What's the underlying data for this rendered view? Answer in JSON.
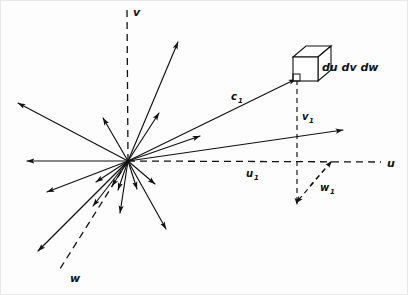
{
  "figure": {
    "background_color": "#fdfdfd",
    "ink_color": "#111111",
    "width": 408,
    "height": 295
  },
  "origin": {
    "x": 128,
    "y": 161,
    "label": ""
  },
  "axes": [
    {
      "name": "u",
      "label": "u",
      "label_x": 389,
      "label_y": 166,
      "style": "dashed",
      "from": {
        "x": 128,
        "y": 161
      },
      "to": {
        "x": 381,
        "y": 162
      }
    },
    {
      "name": "v",
      "label": "v",
      "label_x": 133,
      "label_y": 15,
      "style": "dashed",
      "from": {
        "x": 128,
        "y": 161
      },
      "to": {
        "x": 127,
        "y": 8
      }
    },
    {
      "name": "w",
      "label": "w",
      "label_x": 69,
      "label_y": 281,
      "style": "dashed",
      "from": {
        "x": 128,
        "y": 161
      },
      "to": {
        "x": 58,
        "y": 272
      }
    }
  ],
  "vectors": {
    "c1": {
      "label": "c",
      "subscript": "1",
      "label_x": 233,
      "label_y": 99,
      "from": {
        "x": 128,
        "y": 161
      },
      "to": {
        "x": 296,
        "y": 79
      },
      "style": "solid"
    },
    "u1": {
      "label": "u",
      "subscript": "1",
      "label_x": 248,
      "label_y": 176,
      "description": "horizontal component along u axis"
    },
    "v1": {
      "label": "v",
      "subscript": "1",
      "label_x": 303,
      "label_y": 120,
      "style": "dashed",
      "from": {
        "x": 297,
        "y": 80
      },
      "to": {
        "x": 297,
        "y": 205
      }
    },
    "w1": {
      "label": "w",
      "subscript": "1",
      "label_x": 322,
      "label_y": 190,
      "style": "dashed",
      "from": {
        "x": 331,
        "y": 162
      },
      "to": {
        "x": 296,
        "y": 203
      }
    }
  },
  "volume_element": {
    "label": "du dv dw",
    "label_x": 323,
    "label_y": 70,
    "cube": {
      "front_left": 293,
      "front_top": 57,
      "size": 24,
      "depth_x": 13,
      "depth_y": 11
    }
  },
  "ray_bundle": {
    "count": 17,
    "description": "bundle of direction vectors radiating from the origin point",
    "endpoints": [
      {
        "x": 178,
        "y": 42
      },
      {
        "x": 159,
        "y": 113
      },
      {
        "x": 103,
        "y": 118
      },
      {
        "x": 18,
        "y": 103
      },
      {
        "x": 27,
        "y": 161
      },
      {
        "x": 200,
        "y": 136
      },
      {
        "x": 343,
        "y": 130
      },
      {
        "x": 47,
        "y": 192
      },
      {
        "x": 96,
        "y": 182
      },
      {
        "x": 112,
        "y": 186
      },
      {
        "x": 118,
        "y": 190
      },
      {
        "x": 120,
        "y": 213
      },
      {
        "x": 38,
        "y": 251
      },
      {
        "x": 137,
        "y": 189
      },
      {
        "x": 155,
        "y": 184
      },
      {
        "x": 166,
        "y": 229
      },
      {
        "x": 93,
        "y": 206
      }
    ]
  }
}
